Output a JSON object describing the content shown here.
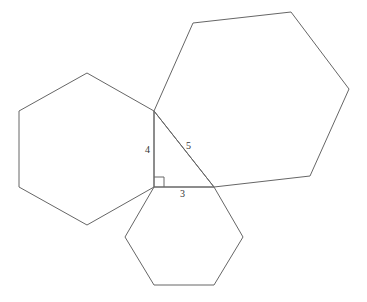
{
  "diagram": {
    "stroke_color": "#555555",
    "triangle": {
      "labels": {
        "vertical": "4",
        "hypotenuse": "5",
        "horizontal": "3"
      }
    },
    "hexagons": [
      {
        "name": "left",
        "points": "87,73 154,111 154,187 87,225 19,187 19,111"
      },
      {
        "name": "large",
        "points": "154,111 193,23 291,12 349,89 310,176 214,187"
      },
      {
        "name": "bottom",
        "points": "154,187 214,187 243,237 214,285 154,285 125,237"
      }
    ]
  }
}
